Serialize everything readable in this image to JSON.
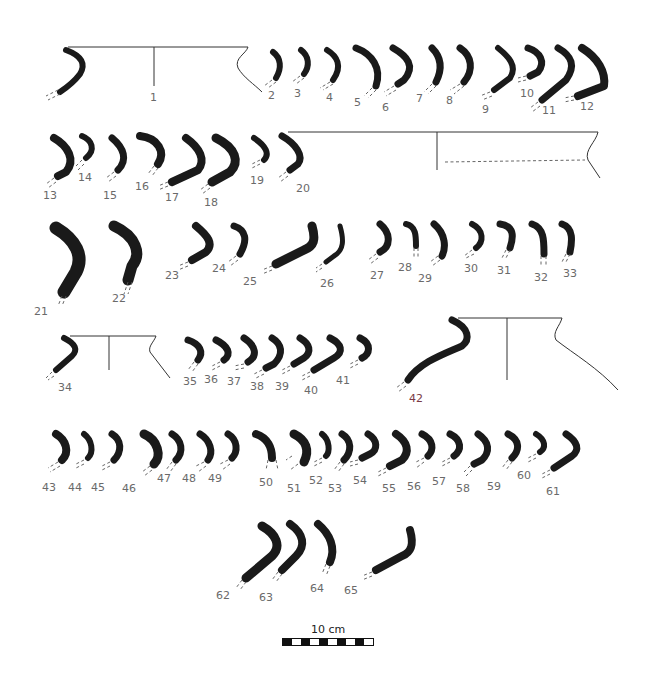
{
  "figure": {
    "background": "#ffffff",
    "ink_color": "#1a1a1a",
    "label_color": "#6a6a6a"
  },
  "labels": [
    {
      "n": "1",
      "x": 150,
      "y": 92
    },
    {
      "n": "2",
      "x": 268,
      "y": 90
    },
    {
      "n": "3",
      "x": 294,
      "y": 88
    },
    {
      "n": "4",
      "x": 326,
      "y": 92
    },
    {
      "n": "5",
      "x": 354,
      "y": 97
    },
    {
      "n": "6",
      "x": 382,
      "y": 102
    },
    {
      "n": "7",
      "x": 416,
      "y": 93
    },
    {
      "n": "8",
      "x": 446,
      "y": 95
    },
    {
      "n": "9",
      "x": 482,
      "y": 104
    },
    {
      "n": "10",
      "x": 520,
      "y": 88
    },
    {
      "n": "11",
      "x": 542,
      "y": 105
    },
    {
      "n": "12",
      "x": 580,
      "y": 101
    },
    {
      "n": "13",
      "x": 43,
      "y": 190
    },
    {
      "n": "14",
      "x": 78,
      "y": 172
    },
    {
      "n": "15",
      "x": 103,
      "y": 190
    },
    {
      "n": "16",
      "x": 135,
      "y": 181
    },
    {
      "n": "17",
      "x": 165,
      "y": 192
    },
    {
      "n": "18",
      "x": 204,
      "y": 197
    },
    {
      "n": "19",
      "x": 250,
      "y": 175
    },
    {
      "n": "20",
      "x": 296,
      "y": 183
    },
    {
      "n": "21",
      "x": 34,
      "y": 306
    },
    {
      "n": "22",
      "x": 112,
      "y": 293
    },
    {
      "n": "23",
      "x": 165,
      "y": 270
    },
    {
      "n": "24",
      "x": 212,
      "y": 263
    },
    {
      "n": "25",
      "x": 243,
      "y": 276
    },
    {
      "n": "26",
      "x": 320,
      "y": 278
    },
    {
      "n": "27",
      "x": 370,
      "y": 270
    },
    {
      "n": "28",
      "x": 398,
      "y": 262
    },
    {
      "n": "29",
      "x": 418,
      "y": 273
    },
    {
      "n": "30",
      "x": 464,
      "y": 263
    },
    {
      "n": "31",
      "x": 497,
      "y": 265
    },
    {
      "n": "32",
      "x": 534,
      "y": 272
    },
    {
      "n": "33",
      "x": 563,
      "y": 268
    },
    {
      "n": "34",
      "x": 58,
      "y": 382
    },
    {
      "n": "35",
      "x": 183,
      "y": 376
    },
    {
      "n": "36",
      "x": 204,
      "y": 374
    },
    {
      "n": "37",
      "x": 227,
      "y": 376
    },
    {
      "n": "38",
      "x": 250,
      "y": 381
    },
    {
      "n": "39",
      "x": 275,
      "y": 381
    },
    {
      "n": "40",
      "x": 304,
      "y": 385
    },
    {
      "n": "41",
      "x": 336,
      "y": 375
    },
    {
      "n": "42",
      "x": 409,
      "y": 393,
      "red": true
    },
    {
      "n": "43",
      "x": 42,
      "y": 482
    },
    {
      "n": "44",
      "x": 68,
      "y": 482
    },
    {
      "n": "45",
      "x": 91,
      "y": 482
    },
    {
      "n": "46",
      "x": 122,
      "y": 483
    },
    {
      "n": "47",
      "x": 157,
      "y": 473
    },
    {
      "n": "48",
      "x": 182,
      "y": 473
    },
    {
      "n": "49",
      "x": 208,
      "y": 473
    },
    {
      "n": "50",
      "x": 259,
      "y": 477
    },
    {
      "n": "51",
      "x": 287,
      "y": 483
    },
    {
      "n": "52",
      "x": 309,
      "y": 475
    },
    {
      "n": "53",
      "x": 328,
      "y": 483
    },
    {
      "n": "54",
      "x": 353,
      "y": 475
    },
    {
      "n": "55",
      "x": 382,
      "y": 483
    },
    {
      "n": "56",
      "x": 407,
      "y": 481
    },
    {
      "n": "57",
      "x": 432,
      "y": 476
    },
    {
      "n": "58",
      "x": 456,
      "y": 483
    },
    {
      "n": "59",
      "x": 487,
      "y": 481
    },
    {
      "n": "60",
      "x": 517,
      "y": 470
    },
    {
      "n": "61",
      "x": 546,
      "y": 486
    },
    {
      "n": "62",
      "x": 216,
      "y": 590
    },
    {
      "n": "63",
      "x": 259,
      "y": 592
    },
    {
      "n": "64",
      "x": 310,
      "y": 583
    },
    {
      "n": "65",
      "x": 344,
      "y": 585
    }
  ],
  "scale": {
    "label": "10 cm",
    "segments": 10,
    "units_cm": 10
  }
}
